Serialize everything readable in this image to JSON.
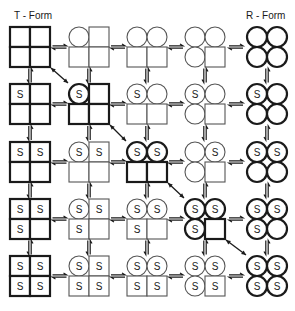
{
  "labels": {
    "left": "T - Form",
    "right": "R - Form"
  },
  "chart_data": {
    "type": "diagram",
    "title": "",
    "column_labels": [
      "T - Form",
      "",
      "",
      "",
      "R - Form"
    ],
    "ligand_symbol": "S",
    "subunit_order": [
      "top-left",
      "top-right",
      "bottom-left",
      "bottom-right"
    ],
    "states": [
      [
        {
          "shape": [
            "T",
            "T",
            "T",
            "T"
          ],
          "S": [
            0,
            0,
            0,
            0
          ],
          "bold": true
        },
        {
          "shape": [
            "R",
            "T",
            "T",
            "T"
          ],
          "S": [
            0,
            0,
            0,
            0
          ],
          "bold": false
        },
        {
          "shape": [
            "R",
            "R",
            "T",
            "T"
          ],
          "S": [
            0,
            0,
            0,
            0
          ],
          "bold": false
        },
        {
          "shape": [
            "R",
            "R",
            "R",
            "T"
          ],
          "S": [
            0,
            0,
            0,
            0
          ],
          "bold": false
        },
        {
          "shape": [
            "R",
            "R",
            "R",
            "R"
          ],
          "S": [
            0,
            0,
            0,
            0
          ],
          "bold": true
        }
      ],
      [
        {
          "shape": [
            "T",
            "T",
            "T",
            "T"
          ],
          "S": [
            1,
            0,
            0,
            0
          ],
          "bold": true
        },
        {
          "shape": [
            "R",
            "T",
            "T",
            "T"
          ],
          "S": [
            1,
            0,
            0,
            0
          ],
          "bold": true
        },
        {
          "shape": [
            "R",
            "R",
            "T",
            "T"
          ],
          "S": [
            1,
            0,
            0,
            0
          ],
          "bold": false
        },
        {
          "shape": [
            "R",
            "R",
            "R",
            "T"
          ],
          "S": [
            1,
            0,
            0,
            0
          ],
          "bold": false
        },
        {
          "shape": [
            "R",
            "R",
            "R",
            "R"
          ],
          "S": [
            1,
            0,
            0,
            0
          ],
          "bold": true
        }
      ],
      [
        {
          "shape": [
            "T",
            "T",
            "T",
            "T"
          ],
          "S": [
            1,
            1,
            0,
            0
          ],
          "bold": true
        },
        {
          "shape": [
            "R",
            "T",
            "T",
            "T"
          ],
          "S": [
            1,
            1,
            0,
            0
          ],
          "bold": false
        },
        {
          "shape": [
            "R",
            "R",
            "T",
            "T"
          ],
          "S": [
            1,
            1,
            0,
            0
          ],
          "bold": true
        },
        {
          "shape": [
            "R",
            "R",
            "R",
            "T"
          ],
          "S": [
            0,
            1,
            0,
            0
          ],
          "bold": false
        },
        {
          "shape": [
            "R",
            "R",
            "R",
            "R"
          ],
          "S": [
            1,
            1,
            0,
            0
          ],
          "bold": true
        }
      ],
      [
        {
          "shape": [
            "T",
            "T",
            "T",
            "T"
          ],
          "S": [
            1,
            1,
            1,
            0
          ],
          "bold": true
        },
        {
          "shape": [
            "R",
            "T",
            "T",
            "T"
          ],
          "S": [
            1,
            1,
            1,
            0
          ],
          "bold": false
        },
        {
          "shape": [
            "R",
            "R",
            "T",
            "T"
          ],
          "S": [
            1,
            1,
            1,
            0
          ],
          "bold": false
        },
        {
          "shape": [
            "R",
            "R",
            "R",
            "T"
          ],
          "S": [
            1,
            1,
            1,
            0
          ],
          "bold": true
        },
        {
          "shape": [
            "R",
            "R",
            "R",
            "R"
          ],
          "S": [
            1,
            1,
            1,
            0
          ],
          "bold": true
        }
      ],
      [
        {
          "shape": [
            "T",
            "T",
            "T",
            "T"
          ],
          "S": [
            1,
            1,
            1,
            1
          ],
          "bold": true
        },
        {
          "shape": [
            "R",
            "T",
            "T",
            "T"
          ],
          "S": [
            1,
            1,
            1,
            1
          ],
          "bold": false
        },
        {
          "shape": [
            "R",
            "R",
            "T",
            "T"
          ],
          "S": [
            1,
            1,
            1,
            1
          ],
          "bold": false
        },
        {
          "shape": [
            "R",
            "R",
            "R",
            "T"
          ],
          "S": [
            1,
            1,
            1,
            1
          ],
          "bold": false
        },
        {
          "shape": [
            "R",
            "R",
            "R",
            "R"
          ],
          "S": [
            1,
            1,
            1,
            1
          ],
          "bold": true
        }
      ]
    ],
    "horizontal_equilibria": "between every adjacent pair in each row (half-arrows ⇌)",
    "vertical_equilibria": "between every adjacent pair in each column (half-arrows ⇌)",
    "diagonal_arrows": [
      {
        "from": [
          0,
          0
        ],
        "to": [
          1,
          1
        ]
      },
      {
        "from": [
          1,
          1
        ],
        "to": [
          2,
          2
        ]
      },
      {
        "from": [
          2,
          2
        ],
        "to": [
          3,
          3
        ]
      },
      {
        "from": [
          3,
          3
        ],
        "to": [
          4,
          4
        ]
      }
    ]
  },
  "layout": {
    "col_x": [
      30,
      89,
      147,
      205,
      267
    ],
    "row_y": [
      47,
      104,
      162,
      219,
      276
    ],
    "cell": 40,
    "stroke": "#1a1a1a",
    "stroke_light": "#555555"
  }
}
